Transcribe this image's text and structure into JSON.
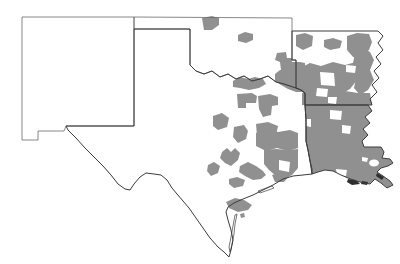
{
  "map": {
    "region_names": [
      "new-mexico",
      "oklahoma",
      "texas",
      "arkansas",
      "louisiana"
    ],
    "colors": {
      "background": "#ffffff",
      "unshaded_fill": "#ffffff",
      "shaded_fill": "#909090",
      "interior_border": "#6a6a6a",
      "outer_border": "#3c3c3c",
      "marsh_dark": "#2e2e2e"
    },
    "states": [
      {
        "name": "new-mexico",
        "shaded": false,
        "stroke": "interior",
        "path": "M 22,17 L 134,17 L 134,126 L 66,126 L 64,131 L 38,131 L 38,140 L 22,140 Z"
      },
      {
        "name": "oklahoma",
        "shaded": false,
        "stroke": "interior",
        "path": "M 134,17 L 292,18 L 292,60 L 296,60 L 296,88 L 290,86 L 284,84 L 276,82 L 268,76 L 260,79 L 252,81 L 244,76 L 236,79 L 228,74 L 220,77 L 212,71 L 204,74 L 196,71 L 190,65 L 190,29 L 134,29 Z"
      },
      {
        "name": "texas",
        "shaded": false,
        "stroke": "outer",
        "path": "M 134,29 L 190,29 L 190,65 L 196,71 L 204,74 L 212,71 L 220,77 L 228,74 L 236,79 L 244,76 L 252,81 L 260,79 L 268,76 L 276,82 L 284,84 L 290,86 L 296,88 L 301,90 L 305,93 L 305,105 L 306,120 L 306,141 L 308,150 L 310,161 L 312,169 L 312,174 L 303,175 L 293,176 L 283,179 L 273,185 L 263,190 L 253,195 L 243,199 L 234,203 L 228,207 L 226,212 L 228,220 L 231,230 L 233,240 L 231,250 L 229,257 L 224,252 L 218,247 L 210,238 L 203,228 L 196,218 L 189,208 L 183,201 L 177,194 L 172,188 L 167,180 L 161,175 L 154,174 L 146,173 L 140,177 L 134,184 L 130,190 L 125,189 L 118,184 L 111,175 L 103,166 L 95,158 L 85,148 L 76,138 L 68,130 L 66,126 L 134,126 Z"
      },
      {
        "name": "arkansas",
        "shaded": false,
        "stroke": "outer",
        "path": "M 292,31 L 378,31 L 383,36 L 378,43 L 383,50 L 376,57 L 381,64 L 374,71 L 379,78 L 372,85 L 377,92 L 370,99 L 372,105 L 305,105 L 305,93 L 301,90 L 296,88 L 296,60 L 292,60 Z"
      },
      {
        "name": "louisiana",
        "shaded": true,
        "stroke": "outer",
        "path": "M 305,105 L 368,105 L 372,111 L 365,117 L 370,123 L 363,129 L 368,135 L 362,141 L 364,147 L 381,147 L 384,152 L 382,158 L 390,159 L 393,163 L 388,166 L 381,168 L 377,172 L 383,176 L 390,181 L 393,185 L 387,188 L 381,183 L 375,179 L 370,184 L 364,183 L 356,181 L 348,178 L 341,175 L 333,171 L 325,170 L 318,172 L 312,174 L 310,161 L 308,150 L 306,141 L 306,120 Z"
      }
    ],
    "shaded_counties": [
      {
        "state": "oklahoma",
        "path": "M 202,18 L 212,16 L 219,18 L 219,25 L 212,30 L 204,30 Z"
      },
      {
        "state": "oklahoma",
        "path": "M 238,35 L 245,32 L 253,34 L 253,40 L 246,43 L 238,41 Z"
      },
      {
        "state": "oklahoma",
        "path": "M 277,53 L 286,52 L 287,58 L 292,58 L 292,70 L 281,70 L 280,62 L 275,60 Z"
      },
      {
        "state": "oklahoma",
        "path": "M 280,70 L 292,70 L 292,62 L 300,62 L 305,63 L 305,92 L 296,92 L 288,89 L 281,85 L 275,81 L 275,74 Z"
      },
      {
        "state": "oklahoma",
        "path": "M 233,81 L 240,77 L 248,79 L 255,77 L 263,79 L 266,84 L 259,88 L 249,90 L 240,88 L 233,87 Z"
      },
      {
        "state": "texas",
        "path": "M 237,94 L 252,93 L 257,96 L 256,103 L 246,103 L 246,108 L 238,108 Z"
      },
      {
        "state": "texas",
        "path": "M 258,96 L 270,94 L 278,97 L 278,105 L 272,106 L 271,115 L 263,117 L 259,109 Z"
      },
      {
        "state": "texas",
        "path": "M 213,116 L 222,113 L 229,118 L 227,127 L 218,130 L 213,126 Z"
      },
      {
        "state": "texas",
        "path": "M 234,127 L 244,125 L 248,131 L 246,139 L 238,143 L 233,137 Z"
      },
      {
        "state": "texas",
        "path": "M 256,124 L 268,122 L 278,126 L 276,136 L 266,140 L 257,136 Z"
      },
      {
        "state": "texas",
        "path": "M 256,133 L 266,130 L 278,132 L 290,130 L 298,133 L 298,148 L 288,151 L 277,148 L 266,151 L 256,146 Z"
      },
      {
        "state": "texas",
        "path": "M 222,152 L 227,148 L 231,152 L 235,148 L 240,153 L 238,160 L 231,166 L 225,163 L 220,158 Z"
      },
      {
        "state": "texas",
        "path": "M 240,166 L 248,162 L 256,166 L 263,171 L 266,175 L 261,179 L 253,180 L 245,176 L 239,172 Z"
      },
      {
        "state": "texas",
        "path": "M 264,150 L 276,149 L 288,150 L 298,149 L 298,168 L 292,175 L 284,179 L 275,175 L 269,170 L 264,164 Z"
      },
      {
        "state": "texas",
        "path": "M 272,175 L 281,172 L 289,176 L 284,182 L 275,182 Z"
      },
      {
        "state": "texas",
        "path": "M 229,179 L 237,177 L 245,180 L 243,186 L 234,188 L 229,184 Z"
      },
      {
        "state": "texas",
        "path": "M 208,165 L 214,162 L 220,166 L 218,173 L 211,176 L 207,171 Z"
      },
      {
        "state": "texas",
        "path": "M 226,202 L 235,198 L 244,200 L 252,205 L 248,210 L 238,212 L 229,208 Z"
      },
      {
        "state": "texas",
        "path": "M 240,214 L 244,213 L 245,217 L 241,218 Z"
      },
      {
        "state": "arkansas",
        "path": "M 296,35 L 305,33 L 313,36 L 312,46 L 303,50 L 296,46 Z"
      },
      {
        "state": "arkansas",
        "path": "M 324,40 L 333,38 L 342,41 L 340,48 L 330,50 L 324,47 Z"
      },
      {
        "state": "arkansas",
        "path": "M 347,36 L 357,33 L 369,34 L 372,42 L 369,50 L 362,55 L 353,57 L 347,50 Z"
      },
      {
        "state": "arkansas",
        "path": "M 300,68 L 310,63 L 321,66 L 333,62 L 345,65 L 356,62 L 360,70 L 357,80 L 350,89 L 341,94 L 329,96 L 317,94 L 306,96 L 300,89 L 297,79 Z"
      },
      {
        "state": "arkansas",
        "path": "M 353,50 L 362,48 L 370,52 L 374,60 L 370,70 L 374,80 L 368,90 L 360,95 L 354,88 L 356,78 L 352,68 L 354,58 Z"
      },
      {
        "state": "arkansas",
        "path": "M 302,93 L 315,91 L 330,93 L 345,91 L 358,93 L 370,93 L 372,105 L 302,105 Z"
      }
    ],
    "unshaded_holes": [
      {
        "path": "M 320,72 L 334,73 L 335,86 L 321,85 Z"
      },
      {
        "path": "M 346,65 L 356,66 L 355,73 L 346,72 Z"
      },
      {
        "path": "M 317,88 L 328,89 L 327,97 L 316,96 Z"
      },
      {
        "path": "M 328,97 L 337,97 L 336,104 L 328,103 Z"
      },
      {
        "path": "M 279,160 L 290,162 L 289,172 L 279,170 Z"
      },
      {
        "path": "M 330,110 L 342,111 L 341,120 L 330,119 Z"
      },
      {
        "path": "M 306,119 L 311,119 L 311,127 L 306,126 Z"
      },
      {
        "path": "M 342,125 L 351,126 L 350,134 L 342,133 Z"
      },
      {
        "path": "M 369,163 a 5,3.5 0 1 0 10,0 a 5,3.5 0 1 0 -10,0 Z"
      },
      {
        "path": "M 362,157 L 368,158 L 367,162 L 362,161 Z"
      },
      {
        "path": "M 336,169 L 347,170 L 346,176 L 337,175 Z"
      }
    ],
    "marsh_patches": [
      {
        "path": "M 348,179 L 356,180 L 360,184 L 352,185 L 347,182 Z"
      },
      {
        "path": "M 362,181 L 368,182 L 367,185 L 361,184 Z"
      },
      {
        "path": "M 377,173 L 384,177 L 382,180 L 376,176 Z"
      }
    ],
    "coast_details": [
      {
        "name": "padre-island",
        "path": "M 237,214 L 235,224 L 234,234 L 232,244 L 230,252 L 229,247 L 231,237 L 233,226 L 235,215 Z"
      },
      {
        "name": "galveston-island",
        "path": "M 258,191 L 272,186 L 274,188 L 260,193 Z"
      }
    ]
  }
}
